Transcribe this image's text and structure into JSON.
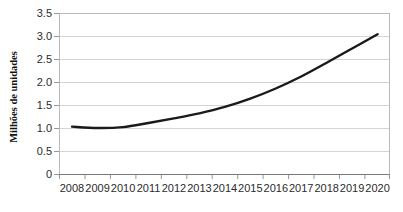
{
  "chart_data": {
    "type": "line",
    "title": "",
    "subtitle": "",
    "xlabel": "",
    "ylabel": "Milhões de unidades",
    "categories": [
      "2008",
      "2009",
      "2010",
      "2011",
      "2012",
      "2013",
      "2014",
      "2015",
      "2016",
      "2017",
      "2018",
      "2019",
      "2020"
    ],
    "x": [
      2008,
      2009,
      2010,
      2011,
      2012,
      2013,
      2014,
      2015,
      2016,
      2017,
      2018,
      2019,
      2020
    ],
    "series": [
      {
        "name": "Milhões de unidades",
        "values": [
          1.04,
          1.01,
          1.03,
          1.12,
          1.22,
          1.33,
          1.47,
          1.65,
          1.87,
          2.13,
          2.43,
          2.74,
          3.05
        ],
        "color": "#1a1a1a"
      }
    ],
    "ylim": [
      0,
      3.5
    ],
    "ytick_values": [
      0,
      0.5,
      1.0,
      1.5,
      2.0,
      2.5,
      3.0,
      3.5
    ],
    "ytick_labels": [
      "0",
      "0.5",
      "1.0",
      "1.5",
      "2.0",
      "2.5",
      "3.0",
      "3.5"
    ],
    "xtick_labels": [
      "2008",
      "2009",
      "2010",
      "2011",
      "2012",
      "2013",
      "2014",
      "2015",
      "2016",
      "2017",
      "2018",
      "2019",
      "2020"
    ],
    "grid": "horizontal",
    "legend": "none",
    "legend_position": "none",
    "annotations": []
  },
  "colors": {
    "background": "#ffffff",
    "series_line": "#1a1a1a",
    "gridline": "#c9c9c9",
    "plot_border": "#b3b3b3",
    "axis_line": "#7a7a7a",
    "tick_text": "#2b2b2b",
    "axis_title_text": "#111111"
  }
}
